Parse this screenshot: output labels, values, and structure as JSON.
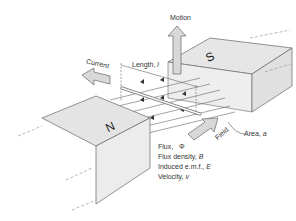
{
  "diagram": {
    "magnets": {
      "north": {
        "label": "N",
        "color": "#e2e2e2"
      },
      "south": {
        "label": "S",
        "color": "#e2e2e2"
      }
    },
    "arrows": {
      "motion": "Motion",
      "current": "Current",
      "field": "Field"
    },
    "labels": {
      "length": "Length, ",
      "length_symbol": "l",
      "area": "Area, ",
      "area_symbol": "a"
    },
    "legend": [
      {
        "text": "Flux,",
        "symbol": "Φ"
      },
      {
        "text": "Flux density, ",
        "symbol": "B"
      },
      {
        "text": "Induced e.m.f., ",
        "symbol": "E"
      },
      {
        "text": "Velocity, ",
        "symbol": "v"
      }
    ],
    "colors": {
      "line": "#555555",
      "arrow_fill": "#d8d8d8",
      "magnet_fill": "#e4e4e4",
      "magnet_side": "#ececec"
    }
  }
}
